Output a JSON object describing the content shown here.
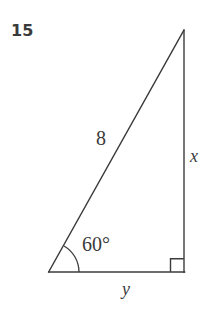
{
  "figure": {
    "problem_number": "15",
    "type": "right-triangle-diagram",
    "stroke_color": "#3b3b3b",
    "background_color": "#ffffff",
    "labels": {
      "hypotenuse": "8",
      "vertical_side": "x",
      "horizontal_side": "y",
      "angle": "60°"
    },
    "geometry": {
      "vertex_left": [
        49,
        272
      ],
      "vertex_apex": [
        184,
        30
      ],
      "vertex_right": [
        184,
        272
      ],
      "right_angle_marker": {
        "size": 13,
        "corner": [
          184,
          272
        ]
      },
      "angle_arc": {
        "center": [
          49,
          272
        ],
        "radius": 30,
        "measure_degrees": 60
      }
    }
  }
}
